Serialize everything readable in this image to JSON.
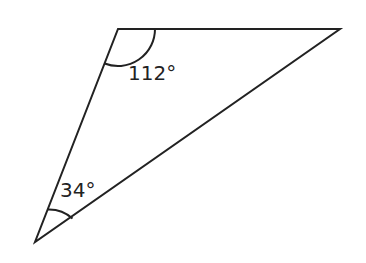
{
  "diagram": {
    "type": "triangle",
    "vertices": {
      "top_left": [
        118,
        29
      ],
      "top_right": [
        340,
        29
      ],
      "bottom_left": [
        35,
        242
      ]
    },
    "angles": [
      {
        "vertex": "top_left",
        "label": "112°"
      },
      {
        "vertex": "bottom_left",
        "label": "34°"
      }
    ],
    "stroke_color": "#222222"
  }
}
